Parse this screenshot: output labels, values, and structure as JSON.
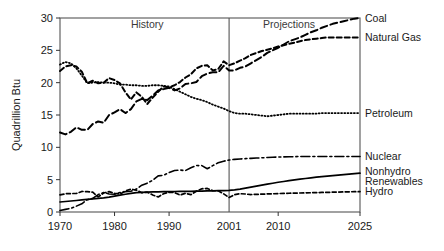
{
  "chart_data": {
    "type": "line",
    "title": "",
    "xlabel": "",
    "ylabel": "Quadrillion Btu",
    "xlim": [
      1970,
      2025
    ],
    "ylim": [
      0,
      30
    ],
    "yticks": [
      0,
      5,
      10,
      15,
      20,
      25,
      30
    ],
    "xticks": [
      1970,
      1980,
      1990,
      2001,
      2010,
      2025
    ],
    "xtick_labels": [
      "1970",
      "1980",
      "1990",
      "2001",
      "2010",
      "2025"
    ],
    "ytick_labels": [
      "0",
      "5",
      "10",
      "15",
      "20",
      "25",
      "30"
    ],
    "grid": false,
    "legend_position": "right-inline",
    "divider_x": 2001,
    "annotations": [
      {
        "name": "history",
        "text": "History",
        "x": 1986,
        "y": 29.0
      },
      {
        "name": "projections",
        "text": "Projections",
        "x": 2012,
        "y": 29.0
      }
    ],
    "x": [
      1970,
      1971,
      1972,
      1973,
      1974,
      1975,
      1976,
      1977,
      1978,
      1979,
      1980,
      1981,
      1982,
      1983,
      1984,
      1985,
      1986,
      1987,
      1988,
      1989,
      1990,
      1991,
      1992,
      1993,
      1994,
      1995,
      1996,
      1997,
      1998,
      1999,
      2000,
      2001,
      2002,
      2003,
      2004,
      2005,
      2006,
      2007,
      2008,
      2009,
      2010,
      2011,
      2012,
      2013,
      2014,
      2015,
      2016,
      2017,
      2018,
      2019,
      2020,
      2021,
      2022,
      2023,
      2024,
      2025
    ],
    "series": [
      {
        "name": "Coal",
        "label": "Coal",
        "style": "long-dash",
        "dash": "7,3.5",
        "width": 2.0,
        "label_y": 30.0,
        "values": [
          12.3,
          12.0,
          12.4,
          13.1,
          12.7,
          12.7,
          13.6,
          14.0,
          13.8,
          15.0,
          15.4,
          15.9,
          15.3,
          15.9,
          17.1,
          17.5,
          17.3,
          18.0,
          18.8,
          19.0,
          19.2,
          18.8,
          19.1,
          19.8,
          19.9,
          20.1,
          21.0,
          21.4,
          21.6,
          21.6,
          22.6,
          21.9,
          21.9,
          22.3,
          22.5,
          23.0,
          23.5,
          24.0,
          24.6,
          25.0,
          25.4,
          25.9,
          26.4,
          26.7,
          27.0,
          27.4,
          27.8,
          28.1,
          28.5,
          28.8,
          29.1,
          29.3,
          29.5,
          29.7,
          29.9,
          30.0
        ]
      },
      {
        "name": "Natural Gas",
        "label": "Natural Gas",
        "style": "medium-dash",
        "dash": "5,3",
        "width": 2.0,
        "label_y": 27.0,
        "values": [
          21.8,
          22.5,
          22.7,
          22.5,
          21.7,
          19.9,
          20.3,
          19.9,
          20.0,
          20.7,
          20.4,
          19.9,
          18.5,
          17.4,
          18.5,
          17.8,
          16.7,
          17.7,
          18.6,
          19.4,
          19.3,
          19.6,
          20.1,
          20.8,
          21.3,
          22.2,
          22.6,
          22.7,
          21.9,
          22.1,
          23.3,
          22.7,
          23.0,
          23.4,
          23.8,
          24.3,
          24.6,
          24.9,
          25.1,
          25.3,
          25.6,
          25.8,
          26.0,
          26.2,
          26.4,
          26.6,
          26.7,
          26.8,
          26.9,
          27.0,
          27.0,
          27.0,
          27.0,
          27.0,
          27.0,
          27.0
        ]
      },
      {
        "name": "Petroleum",
        "label": "Petroleum",
        "style": "dotted",
        "dash": "1,2.2",
        "width": 1.8,
        "label_y": 15.3,
        "values": [
          22.8,
          23.2,
          23.0,
          22.2,
          21.1,
          19.9,
          20.0,
          20.1,
          20.0,
          20.0,
          19.9,
          19.7,
          19.7,
          19.6,
          19.6,
          19.5,
          19.5,
          19.6,
          19.6,
          19.5,
          19.4,
          19.0,
          18.6,
          18.2,
          17.8,
          17.5,
          17.3,
          17.0,
          16.6,
          16.3,
          16.0,
          15.6,
          15.3,
          15.2,
          15.2,
          15.1,
          15.0,
          14.9,
          14.8,
          14.9,
          15.0,
          15.1,
          15.2,
          15.2,
          15.2,
          15.2,
          15.2,
          15.2,
          15.3,
          15.3,
          15.3,
          15.3,
          15.3,
          15.3,
          15.3,
          15.3
        ]
      },
      {
        "name": "Nuclear",
        "label": "Nuclear",
        "style": "dash-dot",
        "dash": "9,3,2,3",
        "width": 1.6,
        "label_y": 8.6,
        "values": [
          0.24,
          0.41,
          0.58,
          0.91,
          1.27,
          1.9,
          2.11,
          2.7,
          3.02,
          2.78,
          2.74,
          3.01,
          3.13,
          3.2,
          3.55,
          4.15,
          4.47,
          4.91,
          5.59,
          5.68,
          6.1,
          6.42,
          6.48,
          6.41,
          6.84,
          7.18,
          7.17,
          6.68,
          7.17,
          7.61,
          7.86,
          8.03,
          8.14,
          8.2,
          8.25,
          8.3,
          8.34,
          8.38,
          8.42,
          8.46,
          8.5,
          8.52,
          8.54,
          8.56,
          8.58,
          8.58,
          8.58,
          8.58,
          8.58,
          8.58,
          8.58,
          8.58,
          8.58,
          8.58,
          8.58,
          8.58
        ]
      },
      {
        "name": "Nonhydro Renewables",
        "label": "Nonhydro\nRenewables",
        "label_line1": "Nonhydro",
        "label_line2": "Renewables",
        "style": "solid",
        "dash": "",
        "width": 1.7,
        "label_y": 5.8,
        "values": [
          1.55,
          1.62,
          1.7,
          1.78,
          1.86,
          1.94,
          2.02,
          2.1,
          2.19,
          2.3,
          2.45,
          2.6,
          2.75,
          2.88,
          3.0,
          3.05,
          3.08,
          3.1,
          3.12,
          3.14,
          3.16,
          3.17,
          3.18,
          3.19,
          3.2,
          3.22,
          3.24,
          3.26,
          3.28,
          3.3,
          3.32,
          3.34,
          3.42,
          3.55,
          3.7,
          3.85,
          4.0,
          4.15,
          4.3,
          4.45,
          4.6,
          4.72,
          4.85,
          4.97,
          5.08,
          5.18,
          5.28,
          5.38,
          5.46,
          5.54,
          5.62,
          5.7,
          5.78,
          5.86,
          5.94,
          6.0
        ]
      },
      {
        "name": "Hydro",
        "label": "Hydro",
        "style": "short-dash",
        "dash": "4,2.5",
        "width": 1.7,
        "label_y": 3.2,
        "values": [
          2.65,
          2.82,
          2.86,
          2.86,
          3.18,
          3.15,
          3.07,
          2.33,
          2.94,
          3.14,
          2.9,
          2.76,
          3.27,
          3.53,
          3.39,
          2.97,
          3.07,
          2.63,
          2.33,
          2.84,
          3.05,
          3.01,
          2.62,
          2.89,
          2.68,
          3.21,
          3.59,
          3.64,
          3.3,
          3.27,
          2.81,
          2.24,
          2.69,
          2.83,
          2.78,
          2.7,
          2.73,
          2.76,
          2.79,
          2.82,
          2.85,
          2.88,
          2.9,
          2.92,
          2.94,
          2.96,
          2.98,
          3.0,
          3.02,
          3.04,
          3.06,
          3.08,
          3.1,
          3.12,
          3.14,
          3.15
        ]
      }
    ]
  }
}
